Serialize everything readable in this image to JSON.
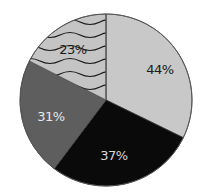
{
  "chart_data": {
    "type": "pie",
    "title": "",
    "start_angle_deg": 0,
    "direction": "clockwise",
    "slices": [
      {
        "label": "44%",
        "value": 44,
        "start_deg": 0,
        "end_deg": 116,
        "fill": "#c8c8c8",
        "pattern": "solid",
        "label_color": "#1a1a1a",
        "label_pos": [
          160,
          69
        ]
      },
      {
        "label": "37%",
        "value": 37,
        "start_deg": 116,
        "end_deg": 217,
        "fill": "#0a0a0a",
        "pattern": "solid",
        "label_color": "#d8d8d8",
        "label_pos": [
          114,
          155
        ]
      },
      {
        "label": "31%",
        "value": 31,
        "start_deg": 217,
        "end_deg": 297,
        "fill": "#5e5e5e",
        "pattern": "solid",
        "label_color": "#e6e6e6",
        "label_pos": [
          51,
          116
        ]
      },
      {
        "label": "23%",
        "value": 23,
        "start_deg": 297,
        "end_deg": 360,
        "fill": "#c4c4c4",
        "pattern": "wavy-lines",
        "label_color": "#1a1a1a",
        "label_pos": [
          73,
          49
        ]
      }
    ],
    "legend": null,
    "outline_color": "#555555",
    "center": [
      106,
      100
    ],
    "radius": 86
  }
}
